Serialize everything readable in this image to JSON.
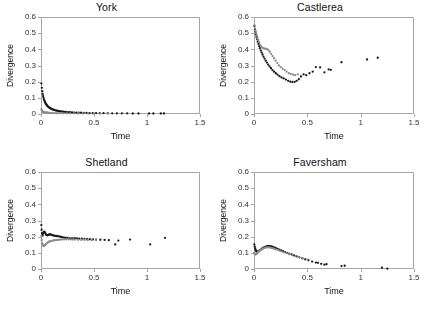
{
  "figure": {
    "panel_order": [
      "york",
      "castlerea",
      "shetland",
      "faversham"
    ],
    "marker_colors": {
      "dark": "#1a1a1a",
      "grey": "#8c8c8c"
    },
    "axis_color": "#a6a6a6",
    "tick_label_color": "#333333"
  },
  "chart_data": [
    {
      "type": "scatter",
      "title": "York",
      "xlabel": "Time",
      "ylabel": "Divergence",
      "xlim": [
        0,
        1.5
      ],
      "ylim": [
        0,
        0.6
      ],
      "xticks": [
        0,
        0.5,
        1,
        1.5
      ],
      "xtick_labels": [
        "0",
        "0.5",
        "1",
        "1.5"
      ],
      "yticks": [
        0,
        0.1,
        0.2,
        0.3,
        0.4,
        0.5,
        0.6
      ],
      "ytick_labels": [
        "0",
        "0.1",
        "0.2",
        "0.3",
        "0.4",
        "0.5",
        "0.6"
      ],
      "grid": false,
      "legend": "none",
      "series": [
        {
          "name": "dark",
          "color": "#1a1a1a",
          "x": [
            0.004,
            0.008,
            0.012,
            0.016,
            0.02,
            0.024,
            0.028,
            0.032,
            0.036,
            0.04,
            0.045,
            0.05,
            0.055,
            0.06,
            0.066,
            0.072,
            0.078,
            0.085,
            0.092,
            0.1,
            0.108,
            0.116,
            0.125,
            0.134,
            0.144,
            0.154,
            0.165,
            0.176,
            0.188,
            0.2,
            0.213,
            0.227,
            0.242,
            0.258,
            0.275,
            0.293,
            0.312,
            0.333,
            0.355,
            0.378,
            0.403,
            0.43,
            0.458,
            0.488,
            0.52,
            0.554,
            0.59,
            0.63,
            0.672,
            0.716,
            0.763,
            0.813,
            0.866,
            0.92,
            1.02,
            1.06,
            1.13,
            1.16
          ],
          "y": [
            0.188,
            0.162,
            0.141,
            0.124,
            0.111,
            0.1,
            0.091,
            0.083,
            0.076,
            0.07,
            0.064,
            0.059,
            0.054,
            0.05,
            0.046,
            0.043,
            0.04,
            0.037,
            0.034,
            0.031,
            0.029,
            0.027,
            0.025,
            0.023,
            0.021,
            0.02,
            0.018,
            0.017,
            0.016,
            0.015,
            0.014,
            0.013,
            0.012,
            0.011,
            0.011,
            0.01,
            0.009,
            0.009,
            0.008,
            0.008,
            0.007,
            0.007,
            0.006,
            0.006,
            0.006,
            0.005,
            0.005,
            0.005,
            0.004,
            0.004,
            0.004,
            0.004,
            0.003,
            0.003,
            0.003,
            0.003,
            0.003,
            0.003
          ]
        },
        {
          "name": "grey",
          "color": "#8c8c8c",
          "x": [
            0.004,
            0.008,
            0.012,
            0.016,
            0.02,
            0.025,
            0.03,
            0.036,
            0.042,
            0.049,
            0.057,
            0.066,
            0.076,
            0.087,
            0.1,
            0.114,
            0.13,
            0.148,
            0.168,
            0.19,
            0.215,
            0.243,
            0.274,
            0.31,
            0.35,
            0.395,
            0.445,
            0.5,
            0.56,
            0.63
          ],
          "y": [
            0.03,
            0.022,
            0.018,
            0.015,
            0.013,
            0.012,
            0.011,
            0.01,
            0.009,
            0.009,
            0.008,
            0.008,
            0.007,
            0.007,
            0.006,
            0.006,
            0.006,
            0.005,
            0.005,
            0.005,
            0.004,
            0.004,
            0.004,
            0.004,
            0.003,
            0.003,
            0.003,
            0.003,
            0.003,
            0.003
          ]
        }
      ]
    },
    {
      "type": "scatter",
      "title": "Castlerea",
      "xlabel": "Time",
      "ylabel": "Divergence",
      "xlim": [
        0,
        1.5
      ],
      "ylim": [
        0,
        0.6
      ],
      "xticks": [
        0,
        0.5,
        1,
        1.5
      ],
      "xtick_labels": [
        "0",
        "0.5",
        "1",
        "1.5"
      ],
      "yticks": [
        0,
        0.1,
        0.2,
        0.3,
        0.4,
        0.5,
        0.6
      ],
      "ytick_labels": [
        "0",
        "0.1",
        "0.2",
        "0.3",
        "0.4",
        "0.5",
        "0.6"
      ],
      "grid": false,
      "legend": "none",
      "series": [
        {
          "name": "dark",
          "color": "#1a1a1a",
          "x": [
            0.004,
            0.008,
            0.013,
            0.018,
            0.023,
            0.029,
            0.035,
            0.041,
            0.048,
            0.055,
            0.063,
            0.071,
            0.08,
            0.089,
            0.099,
            0.11,
            0.121,
            0.133,
            0.146,
            0.159,
            0.173,
            0.188,
            0.204,
            0.221,
            0.239,
            0.258,
            0.278,
            0.299,
            0.32,
            0.34,
            0.36,
            0.382,
            0.4,
            0.42,
            0.44,
            0.465,
            0.49,
            0.52,
            0.55,
            0.58,
            0.62,
            0.66,
            0.7,
            0.72,
            0.82,
            1.06,
            1.16
          ],
          "y": [
            0.545,
            0.525,
            0.508,
            0.492,
            0.477,
            0.462,
            0.448,
            0.434,
            0.42,
            0.407,
            0.394,
            0.381,
            0.368,
            0.355,
            0.343,
            0.33,
            0.318,
            0.306,
            0.294,
            0.283,
            0.272,
            0.262,
            0.252,
            0.243,
            0.234,
            0.226,
            0.22,
            0.213,
            0.205,
            0.2,
            0.198,
            0.199,
            0.205,
            0.215,
            0.232,
            0.245,
            0.24,
            0.252,
            0.262,
            0.29,
            0.288,
            0.258,
            0.276,
            0.273,
            0.32,
            0.337,
            0.348
          ]
        },
        {
          "name": "grey",
          "color": "#8c8c8c",
          "x": [
            0.004,
            0.009,
            0.014,
            0.02,
            0.026,
            0.033,
            0.04,
            0.048,
            0.056,
            0.065,
            0.075,
            0.085,
            0.095,
            0.105,
            0.115,
            0.126,
            0.137,
            0.149,
            0.161,
            0.174,
            0.188,
            0.202,
            0.218,
            0.234,
            0.251,
            0.269,
            0.288,
            0.305,
            0.325,
            0.345,
            0.365,
            0.385,
            0.41
          ],
          "y": [
            0.548,
            0.53,
            0.515,
            0.5,
            0.486,
            0.472,
            0.458,
            0.444,
            0.431,
            0.42,
            0.412,
            0.407,
            0.405,
            0.404,
            0.403,
            0.4,
            0.394,
            0.385,
            0.372,
            0.358,
            0.345,
            0.33,
            0.315,
            0.3,
            0.29,
            0.28,
            0.272,
            0.262,
            0.252,
            0.248,
            0.243,
            0.24,
            0.245
          ]
        }
      ]
    },
    {
      "type": "scatter",
      "title": "Shetland",
      "xlabel": "Time",
      "ylabel": "Divergence",
      "xlim": [
        0,
        1.5
      ],
      "ylim": [
        0,
        0.6
      ],
      "xticks": [
        0,
        0.5,
        1,
        1.5
      ],
      "xtick_labels": [
        "0",
        "0.5",
        "1",
        "1.5"
      ],
      "yticks": [
        0,
        0.1,
        0.2,
        0.3,
        0.4,
        0.5,
        0.6
      ],
      "ytick_labels": [
        "0",
        "0.1",
        "0.2",
        "0.3",
        "0.4",
        "0.5",
        "0.6"
      ],
      "grid": false,
      "legend": "none",
      "series": [
        {
          "name": "dark",
          "color": "#1a1a1a",
          "x": [
            0.003,
            0.006,
            0.009,
            0.012,
            0.016,
            0.02,
            0.025,
            0.03,
            0.035,
            0.04,
            0.046,
            0.052,
            0.058,
            0.065,
            0.072,
            0.08,
            0.088,
            0.096,
            0.105,
            0.114,
            0.124,
            0.134,
            0.145,
            0.156,
            0.168,
            0.18,
            0.193,
            0.206,
            0.22,
            0.235,
            0.25,
            0.266,
            0.283,
            0.3,
            0.32,
            0.34,
            0.36,
            0.385,
            0.41,
            0.435,
            0.46,
            0.49,
            0.52,
            0.56,
            0.6,
            0.64,
            0.7,
            0.73,
            0.84,
            1.03,
            1.17
          ],
          "y": [
            0.272,
            0.243,
            0.222,
            0.206,
            0.21,
            0.22,
            0.228,
            0.231,
            0.228,
            0.222,
            0.215,
            0.21,
            0.208,
            0.209,
            0.212,
            0.214,
            0.214,
            0.212,
            0.21,
            0.208,
            0.206,
            0.205,
            0.204,
            0.203,
            0.202,
            0.2,
            0.198,
            0.196,
            0.194,
            0.193,
            0.192,
            0.19,
            0.189,
            0.19,
            0.191,
            0.19,
            0.188,
            0.187,
            0.186,
            0.185,
            0.184,
            0.183,
            0.182,
            0.181,
            0.18,
            0.178,
            0.152,
            0.176,
            0.182,
            0.152,
            0.193
          ]
        },
        {
          "name": "grey",
          "color": "#8c8c8c",
          "x": [
            0.003,
            0.007,
            0.011,
            0.015,
            0.02,
            0.026,
            0.032,
            0.039,
            0.046,
            0.054,
            0.062,
            0.071,
            0.08,
            0.09,
            0.1,
            0.111,
            0.122,
            0.134,
            0.147,
            0.16,
            0.174,
            0.189,
            0.205,
            0.222,
            0.24,
            0.26,
            0.28,
            0.3,
            0.32,
            0.35,
            0.38,
            0.41,
            0.44,
            0.48,
            0.52
          ],
          "y": [
            0.205,
            0.178,
            0.16,
            0.15,
            0.145,
            0.143,
            0.144,
            0.148,
            0.153,
            0.158,
            0.163,
            0.167,
            0.17,
            0.172,
            0.174,
            0.176,
            0.177,
            0.178,
            0.179,
            0.18,
            0.181,
            0.182,
            0.183,
            0.183,
            0.184,
            0.184,
            0.183,
            0.182,
            0.182,
            0.181,
            0.18,
            0.18,
            0.179,
            0.178,
            0.178
          ]
        }
      ]
    },
    {
      "type": "scatter",
      "title": "Faversham",
      "xlabel": "Time",
      "ylabel": "Divergence",
      "xlim": [
        0,
        1.5
      ],
      "ylim": [
        0,
        0.6
      ],
      "xticks": [
        0,
        0.5,
        1,
        1.5
      ],
      "xtick_labels": [
        "0",
        "0.5",
        "1",
        "1.5"
      ],
      "yticks": [
        0,
        0.1,
        0.2,
        0.3,
        0.4,
        0.5,
        0.6
      ],
      "ytick_labels": [
        "0",
        "0.1",
        "0.2",
        "0.3",
        "0.4",
        "0.5",
        "0.6"
      ],
      "grid": false,
      "legend": "none",
      "series": [
        {
          "name": "dark",
          "color": "#1a1a1a",
          "x": [
            0.003,
            0.007,
            0.011,
            0.015,
            0.02,
            0.025,
            0.031,
            0.037,
            0.044,
            0.051,
            0.059,
            0.067,
            0.076,
            0.085,
            0.095,
            0.105,
            0.116,
            0.127,
            0.139,
            0.151,
            0.164,
            0.177,
            0.191,
            0.206,
            0.221,
            0.237,
            0.254,
            0.272,
            0.29,
            0.31,
            0.33,
            0.352,
            0.375,
            0.4,
            0.425,
            0.452,
            0.48,
            0.51,
            0.545,
            0.58,
            0.6,
            0.63,
            0.66,
            0.68,
            0.82,
            0.85,
            1.2,
            1.25
          ],
          "y": [
            0.152,
            0.138,
            0.127,
            0.118,
            0.112,
            0.108,
            0.106,
            0.107,
            0.11,
            0.114,
            0.118,
            0.122,
            0.126,
            0.13,
            0.134,
            0.137,
            0.14,
            0.142,
            0.143,
            0.142,
            0.14,
            0.137,
            0.133,
            0.129,
            0.125,
            0.12,
            0.115,
            0.11,
            0.105,
            0.1,
            0.095,
            0.09,
            0.084,
            0.078,
            0.072,
            0.066,
            0.06,
            0.054,
            0.046,
            0.04,
            0.038,
            0.032,
            0.027,
            0.03,
            0.018,
            0.02,
            0.008,
            0.002
          ]
        },
        {
          "name": "grey",
          "color": "#8c8c8c",
          "x": [
            0.003,
            0.007,
            0.012,
            0.017,
            0.023,
            0.029,
            0.036,
            0.044,
            0.052,
            0.061,
            0.07,
            0.08,
            0.091,
            0.102,
            0.114,
            0.127,
            0.14,
            0.154,
            0.169,
            0.185,
            0.202,
            0.22,
            0.24,
            0.26,
            0.282,
            0.305,
            0.33,
            0.36,
            0.39,
            0.42,
            0.46,
            0.5
          ],
          "y": [
            0.1,
            0.093,
            0.09,
            0.09,
            0.093,
            0.097,
            0.102,
            0.107,
            0.112,
            0.117,
            0.121,
            0.125,
            0.128,
            0.131,
            0.133,
            0.134,
            0.134,
            0.132,
            0.129,
            0.126,
            0.122,
            0.118,
            0.113,
            0.108,
            0.103,
            0.098,
            0.092,
            0.086,
            0.08,
            0.074,
            0.066,
            0.058
          ]
        }
      ]
    }
  ]
}
